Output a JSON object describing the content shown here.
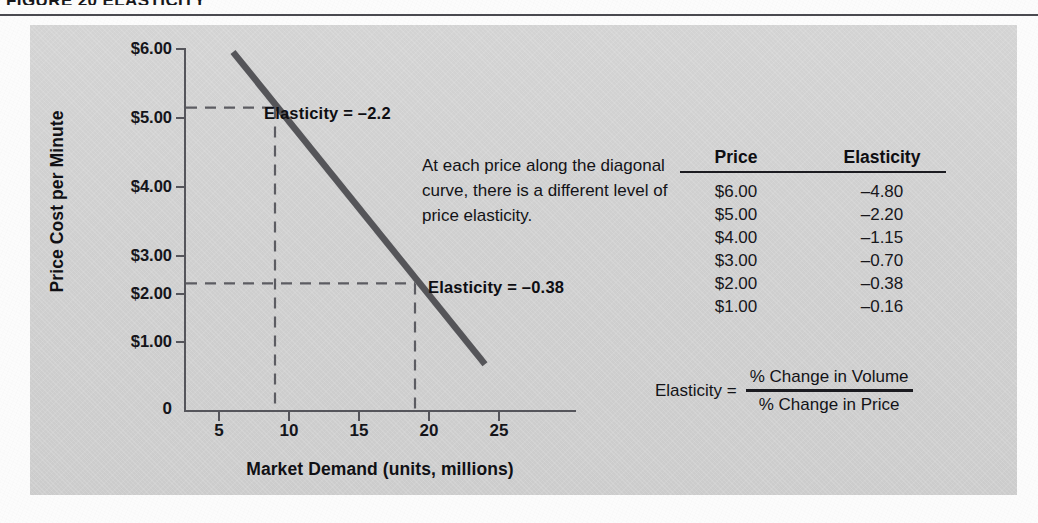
{
  "figure": {
    "caption": "FIGURE 20  ELASTICITY"
  },
  "chart_data": {
    "type": "line",
    "title": "",
    "xlabel": "Market Demand (units, millions)",
    "ylabel": "Price Cost per Minute",
    "xlim": [
      0,
      28
    ],
    "ylim": [
      0,
      6.5
    ],
    "grid": false,
    "legend": "none",
    "x_ticks": [
      "5",
      "10",
      "15",
      "20",
      "25"
    ],
    "x_tick_values": [
      5,
      10,
      15,
      20,
      25
    ],
    "y_ticks": [
      "$1.00",
      "$2.00",
      "$3.00",
      "$4.00",
      "$5.00",
      "$6.00"
    ],
    "y_tick_values": [
      1,
      2,
      3,
      4,
      5,
      6
    ],
    "origin_label": "0",
    "series": [
      {
        "name": "Demand curve",
        "color": "#555559",
        "x": [
          6.0,
          24.0
        ],
        "y": [
          5.95,
          0.62
        ]
      }
    ],
    "guides": [
      {
        "name": "elasticity-2.2-guide",
        "price": 5.0,
        "demand": 9.0,
        "style": "dashed"
      },
      {
        "name": "elasticity-0.38-guide",
        "price": 2.0,
        "demand": 19.0,
        "style": "dashed"
      }
    ],
    "annotations": [
      {
        "name": "elasticity-high",
        "text": "Elasticity = –2.2",
        "price": 5.0,
        "demand": 9.0
      },
      {
        "name": "elasticity-low",
        "text": "Elasticity = –0.38",
        "price": 2.0,
        "demand": 19.0
      }
    ],
    "table": {
      "headers": [
        "Price",
        "Elasticity"
      ],
      "rows": [
        [
          "$6.00",
          "–4.80"
        ],
        [
          "$5.00",
          "–2.20"
        ],
        [
          "$4.00",
          "–1.15"
        ],
        [
          "$3.00",
          "–0.70"
        ],
        [
          "$2.00",
          "–0.38"
        ],
        [
          "$1.00",
          "–0.16"
        ]
      ]
    }
  },
  "blurb": {
    "text": "At each price along the diagonal curve, there is a different level of price elasticity."
  },
  "formula": {
    "lhs": "Elasticity =",
    "numerator": "% Change in Volume",
    "denominator": "% Change in Price"
  },
  "colors": {
    "panel_bg": "#d3d3d3",
    "curve": "#555559",
    "axis": "#55555b",
    "text": "#131317",
    "rule": "#4a4a50"
  }
}
